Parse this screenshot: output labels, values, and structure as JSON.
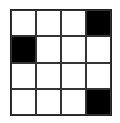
{
  "grid": {
    "rows": 4,
    "cols": 4,
    "colors": {
      "filled": "#000000",
      "empty": "#ffffff"
    },
    "cells": [
      [
        0,
        0,
        0,
        1
      ],
      [
        1,
        0,
        0,
        0
      ],
      [
        0,
        0,
        0,
        0
      ],
      [
        0,
        0,
        0,
        1
      ]
    ]
  }
}
